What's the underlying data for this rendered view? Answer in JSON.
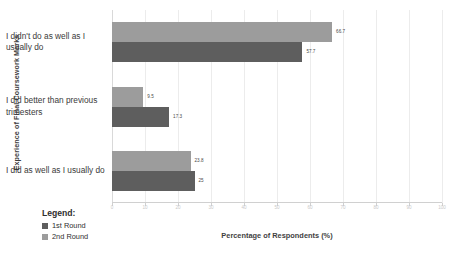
{
  "chart_data": {
    "type": "bar",
    "orientation": "horizontal",
    "title": "",
    "xlabel": "Percentage of Respondents (%)",
    "ylabel": "Experience of Final Coursework Marks",
    "categories": [
      "I didn't do as well as I usually do",
      "I did better than previous trimesters",
      "I did as well as I usually do"
    ],
    "series": [
      {
        "name": "1st Round",
        "color": "#9c9c9c",
        "values": [
          66.7,
          9.5,
          23.8
        ],
        "labels": [
          "66.7",
          "9.5",
          "23.8"
        ]
      },
      {
        "name": "2nd Round",
        "color": "#5e5e5e",
        "values": [
          57.7,
          17.3,
          25
        ],
        "labels": [
          "57.7",
          "17.3",
          "25"
        ]
      }
    ],
    "xlim": [
      0,
      100
    ],
    "xticks": [
      0,
      10,
      20,
      30,
      40,
      50,
      60,
      70,
      80,
      90,
      100
    ],
    "xtick_labels": [
      "0",
      "10",
      "20",
      "30",
      "40",
      "50",
      "60",
      "70",
      "80",
      "90",
      "100"
    ],
    "grid": true,
    "legend_position": "bottom-left"
  },
  "legend": {
    "title": "Legend:"
  }
}
